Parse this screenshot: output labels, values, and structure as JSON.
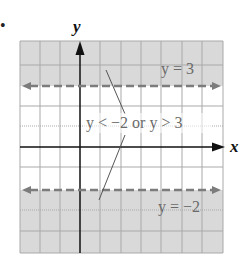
{
  "figure": {
    "bullet": "•",
    "axes": {
      "x_label": "x",
      "y_label": "y"
    },
    "grid": {
      "x_range": [
        -3,
        7
      ],
      "y_range": [
        -5,
        5
      ],
      "cell_units": 1,
      "shaded_color": "#d9d9d9",
      "grid_color": "#a9a9a9",
      "boundary_color": "#7c7c7c"
    },
    "boundaries": [
      {
        "label": "y = 3",
        "value": 3,
        "style": "dashed"
      },
      {
        "label": "y = −2",
        "value": -2,
        "style": "dashed"
      }
    ],
    "solution_label": "y < −2 or y > 3",
    "shaded_regions": [
      "y > 3",
      "y < −2"
    ]
  }
}
